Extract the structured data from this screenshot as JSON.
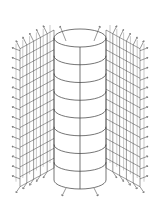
{
  "figure": {
    "colors": {
      "background": "#ffffff",
      "line": "#3a3a3a",
      "arrow": "#555555",
      "ghost_text": "#dcdcdc"
    },
    "cylinder": {
      "rings": 9,
      "vertical_lines": 3
    },
    "lattice_blocks": [
      {
        "side": "left",
        "rows": 14,
        "cols": 5
      },
      {
        "side": "right",
        "rows": 14,
        "cols": 5
      }
    ],
    "arrows": {
      "direction": "outward",
      "top_count": 10,
      "bottom_count": 10
    }
  }
}
